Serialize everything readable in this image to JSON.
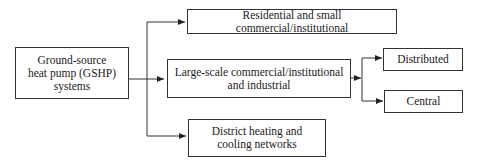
{
  "diagram": {
    "root": {
      "label_lines": [
        "Ground-source",
        "heat pump (GSHP)",
        "systems"
      ]
    },
    "categories": [
      {
        "label_lines": [
          "Residential and small commercial/institutional"
        ]
      },
      {
        "label_lines": [
          "Large-scale commercial/institutional",
          "and industrial"
        ]
      },
      {
        "label_lines": [
          "District heating and",
          "cooling networks"
        ]
      }
    ],
    "subcategories": [
      {
        "label": "Distributed"
      },
      {
        "label": "Central"
      }
    ],
    "colors": {
      "line": "#333333",
      "text": "#1a1a1a",
      "background": "#ffffff"
    }
  }
}
